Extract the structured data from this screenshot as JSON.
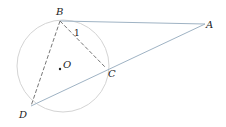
{
  "diagram": {
    "type": "geometry",
    "circle": {
      "center": "O",
      "cx": 63,
      "cy": 66,
      "r": 46,
      "color": "#d0d0d0"
    },
    "points": [
      {
        "name": "B",
        "x": 60,
        "y": 21,
        "label_x": 56,
        "label_y": 15
      },
      {
        "name": "A",
        "x": 205,
        "y": 24,
        "label_x": 206,
        "label_y": 28
      },
      {
        "name": "C",
        "x": 106,
        "y": 68,
        "label_x": 108,
        "label_y": 77
      },
      {
        "name": "D",
        "x": 31,
        "y": 106,
        "label_x": 19,
        "label_y": 118
      },
      {
        "name": "O",
        "x": 60,
        "y": 69,
        "label_x": 63,
        "label_y": 68
      }
    ],
    "segments": [
      {
        "from": "B",
        "to": "A",
        "style": "solid",
        "color": "#9fb3c4"
      },
      {
        "from": "D",
        "to": "A",
        "style": "solid",
        "color": "#9fb3c4"
      },
      {
        "from": "B",
        "to": "C",
        "style": "dashed",
        "color": "#777777"
      },
      {
        "from": "B",
        "to": "D",
        "style": "dashed",
        "color": "#777777"
      }
    ],
    "angle_marks": [
      {
        "label": "1",
        "x": 74,
        "y": 36
      }
    ],
    "labels": {
      "B": "B",
      "A": "A",
      "C": "C",
      "D": "D",
      "O": "O",
      "angle1": "1"
    }
  }
}
